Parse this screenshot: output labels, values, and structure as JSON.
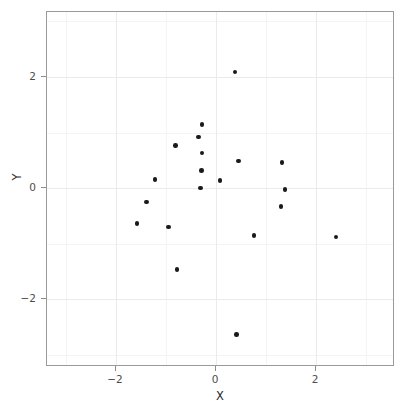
{
  "chart_data": {
    "type": "scatter",
    "title": "",
    "xlabel": "X",
    "ylabel": "Y",
    "xlim": [
      -3.38,
      3.58
    ],
    "ylim": [
      -3.22,
      3.17
    ],
    "grid": true,
    "legend": null,
    "xticks": [
      -2,
      0,
      2
    ],
    "xticklabels": [
      "-2",
      "0",
      "2"
    ],
    "yticks": [
      -2,
      0,
      2
    ],
    "yticklabels": [
      "-2",
      "0",
      "2"
    ],
    "minor_xticks": [
      -3,
      -1,
      1,
      3
    ],
    "minor_yticks": [
      -3,
      -1,
      1,
      3
    ],
    "marker": "filled-circle",
    "marker_color": "#1a1a1a",
    "marker_size": 4.6,
    "points": [
      {
        "x": 0.38,
        "y": 2.09
      },
      {
        "x": -0.28,
        "y": 1.14
      },
      {
        "x": -0.35,
        "y": 0.92
      },
      {
        "x": -0.81,
        "y": 0.77
      },
      {
        "x": -0.28,
        "y": 0.63
      },
      {
        "x": 0.45,
        "y": 0.49
      },
      {
        "x": 1.32,
        "y": 0.46
      },
      {
        "x": -0.29,
        "y": 0.32
      },
      {
        "x": -1.22,
        "y": 0.16
      },
      {
        "x": 0.08,
        "y": 0.14
      },
      {
        "x": -0.31,
        "y": 0.0
      },
      {
        "x": 1.38,
        "y": -0.03
      },
      {
        "x": -1.39,
        "y": -0.25
      },
      {
        "x": 1.3,
        "y": -0.33
      },
      {
        "x": -1.58,
        "y": -0.64
      },
      {
        "x": -0.95,
        "y": -0.7
      },
      {
        "x": 0.76,
        "y": -0.85
      },
      {
        "x": 2.4,
        "y": -0.88
      },
      {
        "x": -0.78,
        "y": -1.46
      },
      {
        "x": 0.41,
        "y": -2.64
      }
    ]
  },
  "panel": {
    "background": "#ffffff",
    "border_color": "#9a9a9a",
    "grid_major_color": "#ebebeb",
    "grid_minor_color": "#f4f4f4",
    "tick_color": "#8c8c8c",
    "label_color": "#4d4d4d"
  }
}
